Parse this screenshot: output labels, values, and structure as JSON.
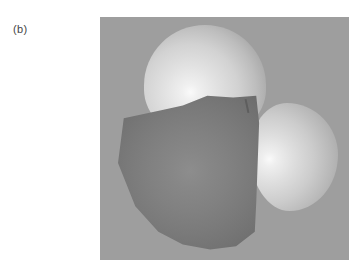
{
  "figure": {
    "panel_label": "(b)",
    "colors": {
      "background": "#9e9e9e",
      "light_sphere": "#e2e2e2",
      "light_sphere_highlight": "#fafafa",
      "dark_sphere": "#7a7a7a"
    }
  }
}
